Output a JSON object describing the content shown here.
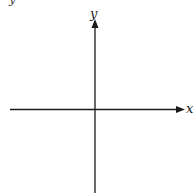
{
  "diagram": {
    "type": "cartesian-axes",
    "axes": {
      "x": {
        "label": "x",
        "direction": "right",
        "arrow": true
      },
      "y": {
        "label": "y",
        "direction": "up",
        "arrow": true
      }
    },
    "top_fragment": "y",
    "colors": {
      "background": "#ffffff",
      "axis": "#1a1a1a"
    }
  }
}
